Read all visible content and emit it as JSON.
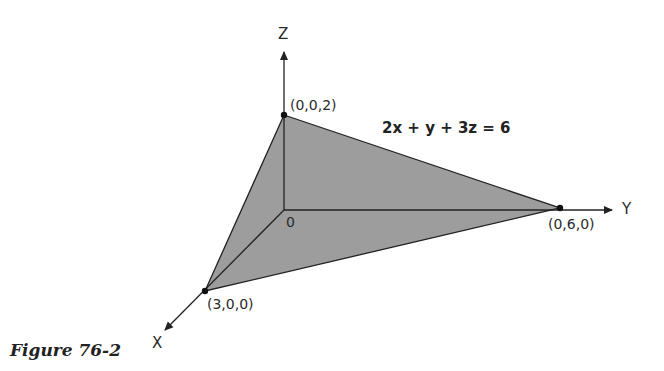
{
  "figure": {
    "caption": "Figure 76-2",
    "equation": "2x + y + 3z = 6",
    "axes": {
      "x_label": "X",
      "y_label": "Y",
      "z_label": "Z",
      "origin_label": "0"
    },
    "points": [
      {
        "label": "(0,0,2)",
        "coords": [
          0,
          0,
          2
        ]
      },
      {
        "label": "(0,6,0)",
        "coords": [
          0,
          6,
          0
        ]
      },
      {
        "label": "(3,0,0)",
        "coords": [
          3,
          0,
          0
        ]
      }
    ],
    "colors": {
      "plane_fill": "#9a9a9a",
      "lines": "#222222",
      "background": "#ffffff"
    }
  }
}
